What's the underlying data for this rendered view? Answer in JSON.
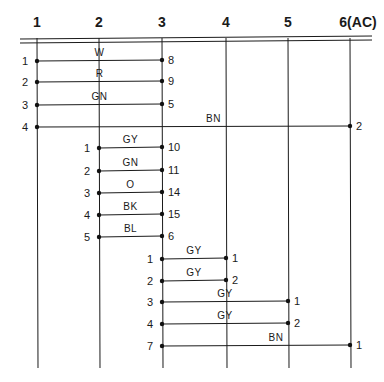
{
  "columns": [
    {
      "id": "1",
      "label": "1",
      "x": 37
    },
    {
      "id": "2",
      "label": "2",
      "x": 99
    },
    {
      "id": "3",
      "label": "3",
      "x": 162
    },
    {
      "id": "4",
      "label": "4",
      "x": 226
    },
    {
      "id": "5",
      "label": "5",
      "x": 288
    },
    {
      "id": "6",
      "label": "6(AC)",
      "x": 350
    }
  ],
  "wires": [
    {
      "from_col": 1,
      "from_pin": "1",
      "to_col": 3,
      "to_pin": "8",
      "color": "W",
      "y": 61
    },
    {
      "from_col": 1,
      "from_pin": "2",
      "to_col": 3,
      "to_pin": "9",
      "color": "R",
      "y": 82
    },
    {
      "from_col": 1,
      "from_pin": "3",
      "to_col": 3,
      "to_pin": "5",
      "color": "GN",
      "y": 105
    },
    {
      "from_col": 1,
      "from_pin": "4",
      "to_col": 6,
      "to_pin": "2",
      "color": "BN",
      "y": 127
    },
    {
      "from_col": 2,
      "from_pin": "1",
      "to_col": 3,
      "to_pin": "10",
      "color": "GY",
      "y": 148
    },
    {
      "from_col": 2,
      "from_pin": "2",
      "to_col": 3,
      "to_pin": "11",
      "color": "GN",
      "y": 171
    },
    {
      "from_col": 2,
      "from_pin": "3",
      "to_col": 3,
      "to_pin": "14",
      "color": "O",
      "y": 193
    },
    {
      "from_col": 2,
      "from_pin": "4",
      "to_col": 3,
      "to_pin": "15",
      "color": "BK",
      "y": 215
    },
    {
      "from_col": 2,
      "from_pin": "5",
      "to_col": 3,
      "to_pin": "6",
      "color": "BL",
      "y": 237
    },
    {
      "from_col": 3,
      "from_pin": "1",
      "to_col": 4,
      "to_pin": "1",
      "color": "GY",
      "y": 259
    },
    {
      "from_col": 3,
      "from_pin": "2",
      "to_col": 4,
      "to_pin": "2",
      "color": "GY",
      "y": 281
    },
    {
      "from_col": 3,
      "from_pin": "3",
      "to_col": 5,
      "to_pin": "1",
      "color": "GY",
      "y": 302
    },
    {
      "from_col": 3,
      "from_pin": "4",
      "to_col": 5,
      "to_pin": "2",
      "color": "GY",
      "y": 324
    },
    {
      "from_col": 3,
      "from_pin": "7",
      "to_col": 6,
      "to_pin": "1",
      "color": "BN",
      "y": 346
    }
  ]
}
